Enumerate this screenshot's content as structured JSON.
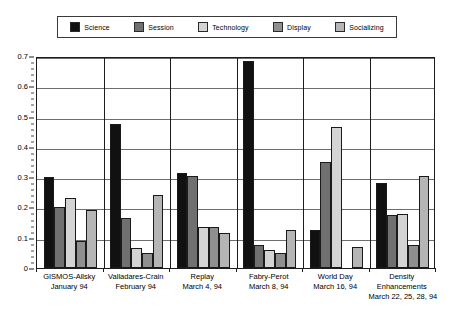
{
  "chart_data": {
    "type": "bar",
    "title": "",
    "xlabel": "",
    "ylabel": "",
    "ylim": [
      0,
      0.7
    ],
    "ytick_step": 0.1,
    "yticks": [
      "0",
      "0.1",
      "0.2",
      "0.3",
      "0.4",
      "0.5",
      "0.6",
      "0.7"
    ],
    "grid": true,
    "legend_position": "top",
    "categories": [
      "GISMOS-Allsky\nJanuary 94",
      "Valladares-Crain\nFebruary 94",
      "Replay\nMarch 4, 94",
      "Fabry-Perot\nMarch 8, 94",
      "World Day\nMarch 16, 94",
      "Density Enhancements\nMarch 22, 25, 28, 94"
    ],
    "category_lines": [
      [
        "GISMOS-Allsky",
        "January 94"
      ],
      [
        "Valladares-Crain",
        "February 94"
      ],
      [
        "Replay",
        "March 4, 94"
      ],
      [
        "Fabry-Perot",
        "March 8, 94"
      ],
      [
        "World Day",
        "March 16, 94"
      ],
      [
        "Density",
        "Enhancements",
        "March 22, 25, 28, 94"
      ]
    ],
    "series": [
      {
        "name": "Science",
        "color": "#111111",
        "values": [
          0.3,
          0.475,
          0.315,
          0.685,
          0.125,
          0.28
        ]
      },
      {
        "name": "Session",
        "color": "#707070",
        "values": [
          0.2,
          0.165,
          0.305,
          0.075,
          0.35,
          0.175
        ]
      },
      {
        "name": "Technology",
        "color": "#d4d4d4",
        "values": [
          0.23,
          0.065,
          0.135,
          0.06,
          0.465,
          0.18
        ]
      },
      {
        "name": "Display",
        "color": "#8f8f8f",
        "values": [
          0.09,
          0.05,
          0.135,
          0.05,
          0.0,
          0.075
        ]
      },
      {
        "name": "Socializing",
        "color": "#b5b5b5",
        "values": [
          0.19,
          0.24,
          0.115,
          0.125,
          0.07,
          0.305
        ]
      }
    ]
  },
  "legend": {
    "items": [
      {
        "label": "Science"
      },
      {
        "label": "Session"
      },
      {
        "label": "Technology"
      },
      {
        "label": "Display"
      },
      {
        "label": "Socializing"
      }
    ]
  }
}
